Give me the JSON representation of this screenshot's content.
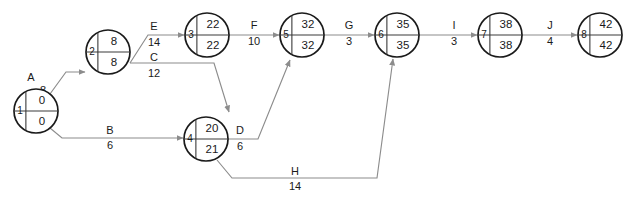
{
  "diagram": {
    "type": "pert-cpm-network",
    "node_colors": {
      "circle_stroke": "#1a1a1a",
      "circle_fill": "#ffffff",
      "divider": "#3a3a3a",
      "edge": "#8c8c8c",
      "text": "#1a1a1a"
    },
    "nodes": [
      {
        "id": "1",
        "early": "0",
        "late": "0",
        "cx": 36,
        "cy": 111,
        "r": 22
      },
      {
        "id": "2",
        "early": "8",
        "late": "8",
        "cx": 108,
        "cy": 52,
        "r": 22
      },
      {
        "id": "3",
        "early": "22",
        "late": "22",
        "cx": 207,
        "cy": 35,
        "r": 22
      },
      {
        "id": "4",
        "early": "20",
        "late": "21",
        "cx": 206,
        "cy": 139,
        "r": 22
      },
      {
        "id": "5",
        "early": "32",
        "late": "32",
        "cx": 302,
        "cy": 35,
        "r": 22
      },
      {
        "id": "6",
        "early": "35",
        "late": "35",
        "cx": 397,
        "cy": 35,
        "r": 22
      },
      {
        "id": "7",
        "early": "38",
        "late": "38",
        "cx": 500,
        "cy": 35,
        "r": 22
      },
      {
        "id": "8",
        "early": "42",
        "late": "42",
        "cx": 600,
        "cy": 35,
        "r": 22
      }
    ],
    "edges": [
      {
        "name": "A",
        "duration": "8",
        "from": "1",
        "to": "2",
        "label_x": 31,
        "label_y": 78,
        "dur_x": 43,
        "dur_y": 91
      },
      {
        "name": "B",
        "duration": "6",
        "from": "1",
        "to": "4",
        "label_x": 110,
        "label_y": 131,
        "dur_x": 110,
        "dur_y": 146
      },
      {
        "name": "E",
        "duration": "14",
        "from": "2",
        "to": "3",
        "label_x": 154,
        "label_y": 27,
        "dur_x": 154,
        "dur_y": 43
      },
      {
        "name": "C",
        "duration": "12",
        "from": "2",
        "to": "4",
        "label_x": 154,
        "label_y": 58,
        "dur_x": 154,
        "dur_y": 74
      },
      {
        "name": "F",
        "duration": "10",
        "from": "3",
        "to": "5",
        "label_x": 254,
        "label_y": 26,
        "dur_x": 254,
        "dur_y": 42
      },
      {
        "name": "D",
        "duration": "6",
        "from": "4",
        "to": "5",
        "label_x": 240,
        "label_y": 131,
        "dur_x": 240,
        "dur_y": 147
      },
      {
        "name": "H",
        "duration": "14",
        "from": "4",
        "to": "6",
        "label_x": 295,
        "label_y": 172,
        "dur_x": 295,
        "dur_y": 187
      },
      {
        "name": "G",
        "duration": "3",
        "from": "5",
        "to": "6",
        "label_x": 349,
        "label_y": 26,
        "dur_x": 349,
        "dur_y": 42
      },
      {
        "name": "I",
        "duration": "3",
        "from": "6",
        "to": "7",
        "label_x": 454,
        "label_y": 26,
        "dur_x": 454,
        "dur_y": 42
      },
      {
        "name": "J",
        "duration": "4",
        "from": "7",
        "to": "8",
        "label_x": 550,
        "label_y": 26,
        "dur_x": 550,
        "dur_y": 42
      }
    ],
    "edge_paths": {
      "A": "M 50 94 L 66 72 L 85 72",
      "B": "M 50 128 L 62 138 L 183 138",
      "E": "M 130 63 L 148 35 L 184 35",
      "C": "M 130 63 L 214 63 L 229 112",
      "F": "M 229 35 L 279 35",
      "D": "M 228 139 L 258 139 L 290 60",
      "H": "M 217 160 L 232 178 L 377 178 L 393 59",
      "G": "M 324 35 L 374 35",
      "I": "M 419 35 L 477 35",
      "J": "M 522 35 L 577 35"
    }
  }
}
